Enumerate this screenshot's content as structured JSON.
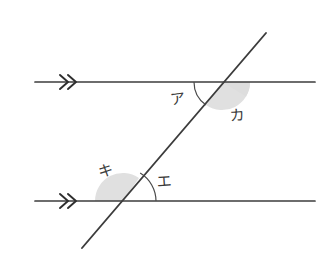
{
  "figure": {
    "background_color": "#ffffff",
    "line_color": "#3c3c3c",
    "shade_color": "#d9d9d9",
    "arc_color": "#4a4a4a",
    "width": 335,
    "height": 277
  },
  "lines": {
    "upper_parallel": {
      "name": "upper parallel line",
      "x1": 35,
      "y1": 82,
      "x2": 315,
      "y2": 82,
      "tick_mark": "double-chevron",
      "tick_symbol": "»",
      "tick_x": 68
    },
    "lower_parallel": {
      "name": "lower parallel line",
      "x1": 35,
      "y1": 201,
      "x2": 315,
      "y2": 201,
      "tick_mark": "double-chevron",
      "tick_symbol": "»",
      "tick_x": 68
    },
    "transversal": {
      "name": "transversal line",
      "x1": 82,
      "y1": 248,
      "x2": 266,
      "y2": 33
    }
  },
  "intersections": {
    "upper": {
      "x": 222,
      "y": 82
    },
    "lower": {
      "x": 123,
      "y": 201
    }
  },
  "angles": [
    {
      "id": "a",
      "label": "ア",
      "romaji": "a",
      "position": "upper-left",
      "marker": "arc",
      "vertex_x": 222,
      "vertex_y": 82,
      "label_x": 178,
      "label_y": 99,
      "arc_radius": 28
    },
    {
      "id": "ka",
      "label": "カ",
      "romaji": "ka",
      "position": "upper-right",
      "marker": "shaded-sector",
      "vertex_x": 222,
      "vertex_y": 82,
      "label_x": 237,
      "label_y": 116,
      "arc_radius": 28
    },
    {
      "id": "ki",
      "label": "キ",
      "romaji": "ki",
      "position": "lower-left",
      "marker": "shaded-sector",
      "vertex_x": 123,
      "vertex_y": 201,
      "label_x": 106,
      "label_y": 171,
      "arc_radius": 28
    },
    {
      "id": "e",
      "label": "エ",
      "romaji": "e",
      "position": "lower-right",
      "marker": "arc",
      "vertex_x": 123,
      "vertex_y": 201,
      "label_x": 164,
      "label_y": 182,
      "arc_radius": 33
    }
  ]
}
